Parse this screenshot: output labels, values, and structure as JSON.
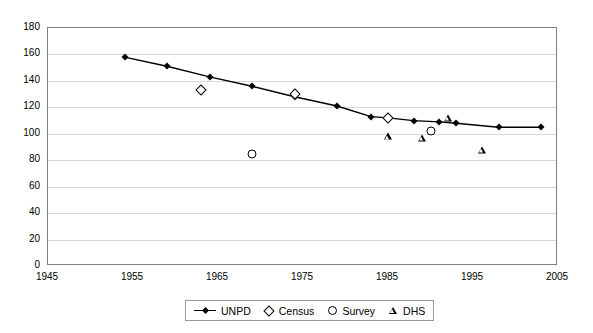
{
  "chart_data": {
    "type": "line",
    "title": "",
    "subtitle": "",
    "xlabel": "",
    "ylabel": "",
    "xlim": [
      1945,
      2005
    ],
    "ylim": [
      0,
      180
    ],
    "xticks": [
      1945,
      1955,
      1965,
      1975,
      1985,
      1995,
      2005
    ],
    "yticks": [
      0,
      20,
      40,
      60,
      80,
      100,
      120,
      140,
      160,
      180
    ],
    "grid": "horizontal",
    "legend_position": "bottom-center",
    "series": [
      {
        "name": "UNPD",
        "style": "line-with-markers",
        "marker": "filled-diamond",
        "color": "#000000",
        "points": [
          {
            "x": 1954,
            "y": 158
          },
          {
            "x": 1959,
            "y": 151
          },
          {
            "x": 1964,
            "y": 143
          },
          {
            "x": 1969,
            "y": 136
          },
          {
            "x": 1974,
            "y": 128
          },
          {
            "x": 1979,
            "y": 121
          },
          {
            "x": 1983,
            "y": 113
          },
          {
            "x": 1985,
            "y": 112
          },
          {
            "x": 1988,
            "y": 110
          },
          {
            "x": 1991,
            "y": 109
          },
          {
            "x": 1993,
            "y": 108
          },
          {
            "x": 1998,
            "y": 105
          },
          {
            "x": 2003,
            "y": 105
          }
        ]
      },
      {
        "name": "Census",
        "style": "markers",
        "marker": "open-diamond",
        "color": "#000000",
        "points": [
          {
            "x": 1963,
            "y": 133
          },
          {
            "x": 1974,
            "y": 130
          },
          {
            "x": 1985,
            "y": 112
          }
        ]
      },
      {
        "name": "Survey",
        "style": "markers",
        "marker": "open-circle",
        "color": "#000000",
        "points": [
          {
            "x": 1969,
            "y": 85
          },
          {
            "x": 1990,
            "y": 102
          }
        ]
      },
      {
        "name": "DHS",
        "style": "markers",
        "marker": "open-triangle",
        "color": "#000000",
        "points": [
          {
            "x": 1985,
            "y": 98
          },
          {
            "x": 1989,
            "y": 97
          },
          {
            "x": 1992,
            "y": 112
          },
          {
            "x": 1996,
            "y": 88
          }
        ]
      }
    ]
  },
  "legend": {
    "entries": [
      {
        "label": "UNPD",
        "symbol": "line-diamond-icon"
      },
      {
        "label": "Census",
        "symbol": "open-diamond-icon"
      },
      {
        "label": "Survey",
        "symbol": "open-circle-icon"
      },
      {
        "label": "DHS",
        "symbol": "open-triangle-icon"
      }
    ]
  }
}
